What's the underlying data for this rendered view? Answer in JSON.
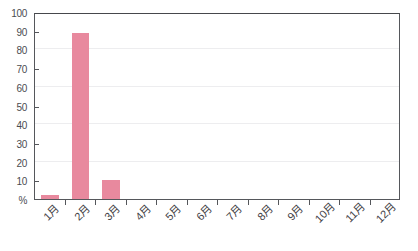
{
  "chart_data": {
    "type": "bar",
    "title": "",
    "subtitle": "",
    "xlabel": "",
    "ylabel": "%",
    "categories": [
      "1月",
      "2月",
      "3月",
      "4月",
      "5月",
      "6月",
      "7月",
      "8月",
      "9月",
      "10月",
      "11月",
      "12月"
    ],
    "values": [
      2,
      89,
      10,
      0,
      0,
      0,
      0,
      0,
      0,
      0,
      0,
      0
    ],
    "ylim": [
      0,
      100
    ],
    "ytick_labels": [
      "%",
      "10",
      "20",
      "30",
      "40",
      "50",
      "60",
      "70",
      "80",
      "90",
      "100"
    ],
    "ytick_values": [
      0,
      10,
      20,
      30,
      40,
      50,
      60,
      70,
      80,
      90,
      100
    ],
    "ytick_marked_values": [
      10,
      30,
      50,
      70,
      90
    ],
    "gridline_values": [
      20,
      40,
      60,
      80
    ],
    "grid": true,
    "legend": false,
    "legend_position": "none",
    "bar_color": "#e8899e",
    "axis_color": "#55575b",
    "grid_color": "#ededef",
    "label_color": "#4a4c50",
    "background": "#ffffff"
  }
}
